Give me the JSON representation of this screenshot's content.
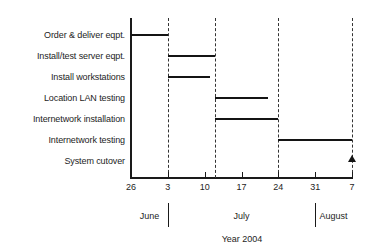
{
  "chart_data": {
    "type": "bar",
    "subtype": "gantt",
    "title": "",
    "xlabel": "Year 2004",
    "ylabel": "",
    "grid": true,
    "legend": null,
    "x_axis": {
      "tick_labels": [
        "26",
        "3",
        "10",
        "17",
        "24",
        "31",
        "7"
      ],
      "tick_days": [
        0,
        7,
        14,
        21,
        28,
        35,
        42
      ],
      "range_days": [
        0,
        42
      ],
      "start_date": "June 26",
      "end_date": "August 7"
    },
    "months": [
      {
        "label": "June",
        "center_day": 3.5
      },
      {
        "label": "July",
        "center_day": 21.0
      },
      {
        "label": "August",
        "center_day": 38.5
      }
    ],
    "month_separators_days": [
      7,
      35
    ],
    "year_caption": "Year 2004",
    "gridlines_days": [
      7,
      16,
      28,
      42
    ],
    "categories": [
      "Order & deliver eqpt.",
      "Install/test server eqpt.",
      "Install workstations",
      "Location LAN testing",
      "Internetwork installation",
      "Internetwork testing",
      "System cutover"
    ],
    "tasks": [
      {
        "name": "Order & deliver eqpt.",
        "start_day": 0,
        "end_day": 7,
        "kind": "bar"
      },
      {
        "name": "Install/test server eqpt.",
        "start_day": 7,
        "end_day": 16,
        "kind": "bar"
      },
      {
        "name": "Install workstations",
        "start_day": 7,
        "end_day": 15,
        "kind": "bar"
      },
      {
        "name": "Location LAN testing",
        "start_day": 16,
        "end_day": 26,
        "kind": "bar"
      },
      {
        "name": "Internetwork installation",
        "start_day": 16,
        "end_day": 28,
        "kind": "bar"
      },
      {
        "name": "Internetwork testing",
        "start_day": 28,
        "end_day": 42,
        "kind": "bar"
      },
      {
        "name": "System cutover",
        "start_day": 42,
        "end_day": 42,
        "kind": "milestone"
      }
    ],
    "colors": {
      "bar": "#141414",
      "axis": "#1a1a1a",
      "gridline": "#333333",
      "text": "#1d1d1d",
      "background": "#ffffff"
    }
  }
}
